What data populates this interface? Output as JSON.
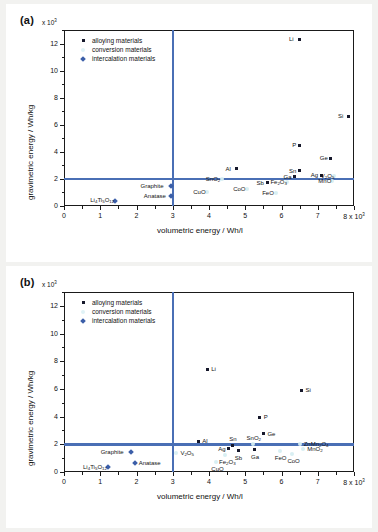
{
  "figure": {
    "background": "#f2f2f0",
    "accent": "#4a6fb5",
    "alloy_color": "#16182b",
    "conversion_color": "#d6eef2",
    "intercalation_color": "#3b5ea8"
  },
  "legend": {
    "position": "top-left-inside",
    "entries": [
      {
        "label": "alloying materials",
        "marker": "alloy-square-marker"
      },
      {
        "label": "conversion materials",
        "marker": "conversion-circle-marker"
      },
      {
        "label": "intercalation materials",
        "marker": "intercalation-diamond-marker"
      }
    ]
  },
  "axes": {
    "x_label": "volumetric energy / Wh/l",
    "y_label": "gravimetric energy / Wh/kg",
    "x_multiplier": "x 10",
    "x_multiplier_exp": "3",
    "y_multiplier": "x 10",
    "y_multiplier_exp": "3",
    "x_ticks": [
      "0",
      "1",
      "2",
      "3",
      "4",
      "5",
      "6",
      "7",
      "8 x 10"
    ],
    "x_last_exp": "3",
    "y_ticks": [
      "0",
      "2",
      "4",
      "6",
      "8",
      "10",
      "12"
    ],
    "x_range": [
      0,
      8
    ],
    "y_range": [
      0,
      13
    ],
    "x_guide": 3,
    "y_guide": 2,
    "grid": false
  },
  "chart_data": [
    {
      "type": "scatter",
      "panel": "(a)",
      "title": "",
      "xlabel": "volumetric energy / Wh/l",
      "ylabel": "gravimetric energy / Wh/kg",
      "xlim": [
        0,
        8
      ],
      "ylim": [
        0,
        13
      ],
      "x_unit": "x 10^3 Wh/l",
      "y_unit": "x 10^3 Wh/kg",
      "grid": false,
      "reference_lines": {
        "vertical_x": 3,
        "horizontal_y": 2
      },
      "series": [
        {
          "name": "alloying materials",
          "marker": "square",
          "color": "#16182b",
          "points": [
            {
              "label": "Li",
              "x": 6.5,
              "y": 12.3,
              "label_side": "left"
            },
            {
              "label": "Si",
              "x": 7.85,
              "y": 6.6,
              "label_side": "left"
            },
            {
              "label": "P",
              "x": 6.5,
              "y": 4.5,
              "label_side": "left"
            },
            {
              "label": "Ge",
              "x": 7.35,
              "y": 3.5,
              "label_side": "left"
            },
            {
              "label": "Al",
              "x": 4.75,
              "y": 2.75,
              "label_side": "left"
            },
            {
              "label": "Sn",
              "x": 6.5,
              "y": 2.6,
              "label_side": "left"
            },
            {
              "label": "Ag",
              "x": 7.1,
              "y": 2.25,
              "label_side": "left"
            },
            {
              "label": "Ga",
              "x": 6.35,
              "y": 2.15,
              "label_side": "left"
            },
            {
              "label": "Sb",
              "x": 5.6,
              "y": 1.7,
              "label_side": "left"
            }
          ]
        },
        {
          "name": "conversion materials",
          "marker": "circle",
          "color": "#d6eef2",
          "points": [
            {
              "label": "SnO",
              "sub": "2",
              "x": 4.35,
              "y": 2.0,
              "label_side": "left"
            },
            {
              "label": "V",
              "sub": "2O5",
              "x": 7.45,
              "y": 2.2,
              "label_side": "left"
            },
            {
              "label": "MnO",
              "x": 7.4,
              "y": 1.82,
              "label_side": "left"
            },
            {
              "label": "Fe",
              "sub": "2O3",
              "x": 6.15,
              "y": 1.75,
              "label_side": "left"
            },
            {
              "label": "CoO",
              "x": 5.05,
              "y": 1.25,
              "label_side": "left"
            },
            {
              "label": "CuO",
              "x": 3.95,
              "y": 1.0,
              "label_side": "left"
            },
            {
              "label": "FeO",
              "x": 5.85,
              "y": 0.95,
              "label_side": "left"
            }
          ]
        },
        {
          "name": "intercalation materials",
          "marker": "diamond",
          "color": "#3b5ea8",
          "points": [
            {
              "label": "Graphite",
              "x": 2.95,
              "y": 1.45,
              "label_side": "left"
            },
            {
              "label": "Anatase",
              "x": 2.95,
              "y": 0.75,
              "label_side": "left"
            },
            {
              "label": "Li",
              "sub": "4Ti5O12",
              "x": 1.4,
              "y": 0.4,
              "label_side": "left"
            }
          ]
        }
      ]
    },
    {
      "type": "scatter",
      "panel": "(b)",
      "title": "",
      "xlabel": "volumetric energy / Wh/l",
      "ylabel": "gravimetric energy / Wh/kg",
      "xlim": [
        0,
        8
      ],
      "ylim": [
        0,
        13
      ],
      "x_unit": "x 10^3 Wh/l",
      "y_unit": "x 10^3 Wh/kg",
      "grid": false,
      "reference_lines": {
        "vertical_x": 3,
        "horizontal_y": 2
      },
      "series": [
        {
          "name": "alloying materials",
          "marker": "square",
          "color": "#16182b",
          "points": [
            {
              "label": "Li",
              "x": 3.95,
              "y": 7.4,
              "label_side": "right"
            },
            {
              "label": "Si",
              "x": 6.55,
              "y": 5.9,
              "label_side": "right"
            },
            {
              "label": "P",
              "x": 5.4,
              "y": 3.95,
              "label_side": "right"
            },
            {
              "label": "Ge",
              "x": 5.5,
              "y": 2.75,
              "label_side": "right"
            },
            {
              "label": "Al",
              "x": 3.7,
              "y": 2.2,
              "label_side": "right"
            },
            {
              "label": "Sn",
              "x": 4.65,
              "y": 1.95,
              "label_side": "top"
            },
            {
              "label": "Ag",
              "x": 4.55,
              "y": 1.68,
              "label_side": "left"
            },
            {
              "label": "Sb",
              "x": 4.8,
              "y": 1.52,
              "label_side": "bottom"
            },
            {
              "label": "Ga",
              "x": 5.25,
              "y": 1.62,
              "label_side": "bottom"
            }
          ]
        },
        {
          "name": "conversion materials",
          "marker": "circle",
          "color": "#d6eef2",
          "points": [
            {
              "label": "SnO",
              "sub": "2",
              "x": 5.2,
              "y": 2.0,
              "label_side": "top"
            },
            {
              "label": "ZnMn",
              "sub": "2O4",
              "x": 6.5,
              "y": 2.0,
              "label_side": "right"
            },
            {
              "label": "MnO",
              "sub": "2",
              "x": 6.6,
              "y": 1.65,
              "label_side": "right"
            },
            {
              "label": "FeO",
              "x": 5.95,
              "y": 1.5,
              "label_side": "bottom"
            },
            {
              "label": "CoO",
              "x": 6.3,
              "y": 1.3,
              "label_side": "bottom"
            },
            {
              "label": "Fe",
              "sub": "2O3",
              "x": 4.45,
              "y": 1.25,
              "label_side": "bottom"
            },
            {
              "label": "CuO",
              "x": 4.2,
              "y": 0.75,
              "label_side": "bottom"
            },
            {
              "label": "V",
              "sub": "2O5",
              "x": 3.1,
              "y": 1.35,
              "label_side": "right"
            }
          ]
        },
        {
          "name": "intercalation materials",
          "marker": "diamond",
          "color": "#3b5ea8",
          "points": [
            {
              "label": "Graphite",
              "x": 1.85,
              "y": 1.45,
              "label_side": "left"
            },
            {
              "label": "Anatase",
              "x": 1.95,
              "y": 0.65,
              "label_side": "right"
            },
            {
              "label": "Li",
              "sub": "4Ti5O12",
              "x": 1.2,
              "y": 0.35,
              "label_side": "left"
            }
          ]
        }
      ]
    }
  ]
}
